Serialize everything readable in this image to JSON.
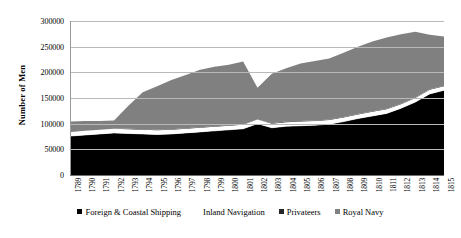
{
  "chart_data": {
    "type": "area",
    "stacked": true,
    "title": "",
    "xlabel": "",
    "ylabel": "Number of Men",
    "ylim": [
      0,
      300000
    ],
    "ytick_labels": [
      "0",
      "50000",
      "100000",
      "150000",
      "200000",
      "250000",
      "300000"
    ],
    "ytick_values": [
      0,
      50000,
      100000,
      150000,
      200000,
      250000,
      300000
    ],
    "grid": true,
    "legend_position": "bottom",
    "categories": [
      "1789",
      "1790",
      "1791",
      "1792",
      "1793",
      "1794",
      "1795",
      "1796",
      "1797",
      "1798",
      "1799",
      "1800",
      "1801",
      "1802",
      "1803",
      "1804",
      "1805",
      "1806",
      "1807",
      "1808",
      "1809",
      "1810",
      "1811",
      "1812",
      "1813",
      "1814",
      "1815"
    ],
    "series": [
      {
        "name": "Foreign & Coastal Shipping",
        "color": "#000000",
        "values": [
          76000,
          78000,
          80000,
          82000,
          81000,
          80000,
          79000,
          80000,
          82000,
          84000,
          86000,
          88000,
          90000,
          100000,
          92000,
          95000,
          96000,
          97000,
          99000,
          104000,
          110000,
          115000,
          120000,
          130000,
          142000,
          158000,
          165000
        ]
      },
      {
        "name": "Inland Navigation",
        "color": "#ffffff",
        "values": [
          8000,
          8000,
          8000,
          8000,
          8000,
          8000,
          8000,
          8000,
          8000,
          8000,
          8000,
          8000,
          8000,
          8000,
          8000,
          8000,
          8000,
          8000,
          8000,
          8000,
          8000,
          8000,
          8000,
          8000,
          8000,
          8000,
          8000
        ]
      },
      {
        "name": "Privateers",
        "color": "#262626",
        "values": [
          0,
          0,
          0,
          0,
          1000,
          1000,
          1000,
          1000,
          1000,
          1000,
          1000,
          1000,
          1000,
          0,
          1000,
          1000,
          1000,
          1000,
          1000,
          1000,
          1000,
          1000,
          1000,
          1000,
          1000,
          1000,
          1000
        ]
      },
      {
        "name": "Royal Navy",
        "color": "#808080",
        "values": [
          20000,
          19000,
          17000,
          16000,
          45000,
          72000,
          85000,
          96000,
          104000,
          112000,
          116000,
          118000,
          122000,
          62000,
          96000,
          104000,
          112000,
          116000,
          119000,
          125000,
          131000,
          136000,
          139000,
          135000,
          128000,
          106000,
          96000
        ]
      }
    ],
    "totals": [
      104000,
      105000,
      105000,
      106000,
      135000,
      161000,
      173000,
      185000,
      195000,
      205000,
      211000,
      215000,
      221000,
      170000,
      197000,
      208000,
      217000,
      222000,
      227000,
      238000,
      250000,
      260000,
      268000,
      274000,
      279000,
      273000,
      270000
    ]
  },
  "legend": {
    "items": [
      {
        "label": "Foreign & Coastal Shipping",
        "color": "#000000"
      },
      {
        "label": "Inland Navigation",
        "color": "#ffffff"
      },
      {
        "label": "Privateers",
        "color": "#262626"
      },
      {
        "label": "Royal Navy",
        "color": "#808080"
      }
    ]
  }
}
